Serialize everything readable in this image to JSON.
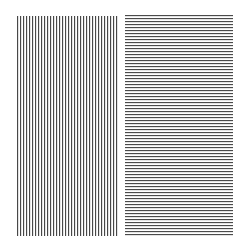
{
  "panels": [
    {
      "id": "left",
      "orientation": "vertical-stripes",
      "stripe_color": "#3a3a3a",
      "background": "#ffffff",
      "period_px": 3
    },
    {
      "id": "right",
      "orientation": "horizontal-stripes",
      "stripe_color": "#3c3c3c",
      "background": "#ffffff",
      "period_px": 3
    }
  ]
}
